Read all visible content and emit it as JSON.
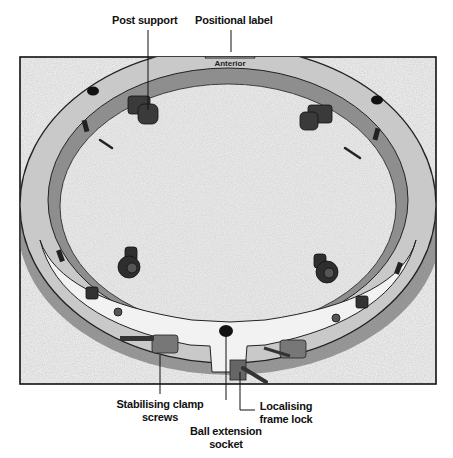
{
  "diagram": {
    "ring_engraving": "Anterior",
    "labels": {
      "post_support": "Post support",
      "positional_label": "Positional label",
      "stabilising_clamp_screws_line1": "Stabilising clamp",
      "stabilising_clamp_screws_line2": "screws",
      "ball_extension_socket_line1": "Ball extension",
      "ball_extension_socket_line2": "socket",
      "localising_frame_lock_line1": "Localising",
      "localising_frame_lock_line2": "frame lock"
    },
    "colors": {
      "ring_fill": "#c9c9c9",
      "ring_inner_band": "#8e8e8e",
      "post_dark": "#3a3a3a",
      "background_speckle": "#d8d8d8",
      "frame_border": "#111111"
    }
  }
}
